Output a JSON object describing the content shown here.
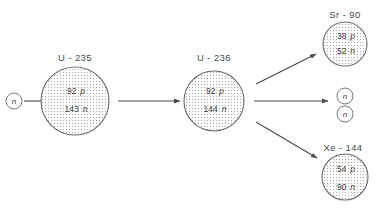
{
  "diagram": {
    "colors": {
      "stroke": "#6b6b6b",
      "text": "#3d3d3d",
      "label": "#4a4a4a",
      "background": "#ffffff",
      "stipple": "#9a9a9a"
    },
    "incoming_neutron": {
      "glyph": "n"
    },
    "reactant": {
      "label": "U - 235",
      "protons": "92",
      "proton_symbol": "p",
      "neutrons": "143",
      "neutron_symbol": "n"
    },
    "compound": {
      "label": "U - 236",
      "protons": "92",
      "proton_symbol": "p",
      "neutrons": "144",
      "neutron_symbol": "n"
    },
    "products": [
      {
        "label": "Sr - 90",
        "protons": "38",
        "proton_symbol": "p",
        "neutrons": "52",
        "neutron_symbol": "n"
      },
      {
        "label": "Xe - 144",
        "protons": "54",
        "proton_symbol": "p",
        "neutrons": "90",
        "neutron_symbol": "n"
      }
    ],
    "emitted_neutrons": [
      {
        "glyph": "n"
      },
      {
        "glyph": "n"
      }
    ]
  }
}
